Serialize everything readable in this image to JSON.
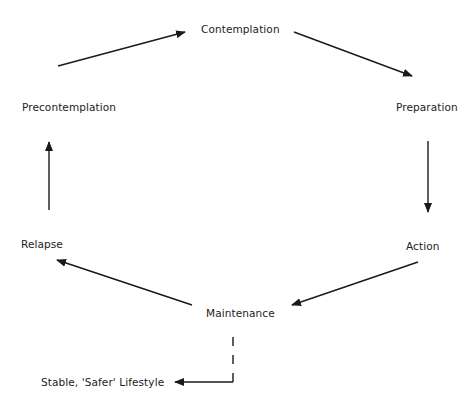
{
  "diagram": {
    "type": "cycle",
    "stages": [
      {
        "id": "contemplation",
        "label": "Contemplation"
      },
      {
        "id": "preparation",
        "label": "Preparation"
      },
      {
        "id": "action",
        "label": "Action"
      },
      {
        "id": "maintenance",
        "label": "Maintenance"
      },
      {
        "id": "relapse",
        "label": "Relapse"
      },
      {
        "id": "precontemplation",
        "label": "Precontemplation"
      }
    ],
    "exit": {
      "id": "stable",
      "label": "Stable, 'Safer' Lifestyle"
    },
    "edges": [
      {
        "from": "precontemplation",
        "to": "contemplation",
        "style": "solid"
      },
      {
        "from": "contemplation",
        "to": "preparation",
        "style": "solid"
      },
      {
        "from": "preparation",
        "to": "action",
        "style": "solid"
      },
      {
        "from": "action",
        "to": "maintenance",
        "style": "solid"
      },
      {
        "from": "maintenance",
        "to": "relapse",
        "style": "solid"
      },
      {
        "from": "relapse",
        "to": "precontemplation",
        "style": "solid"
      },
      {
        "from": "maintenance",
        "to": "stable",
        "style": "dashed"
      }
    ],
    "colors": {
      "line": "#1a1a1a",
      "text": "#222222",
      "background": "#ffffff"
    }
  }
}
